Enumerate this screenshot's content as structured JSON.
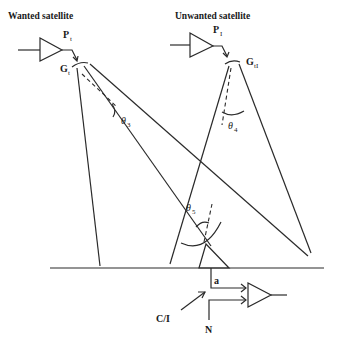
{
  "diagram": {
    "wanted_satellite": {
      "title": "Wanted satellite",
      "power_label": "P",
      "power_sub": "t",
      "gain_label": "G",
      "gain_sub": "t"
    },
    "unwanted_satellite": {
      "title": "Unwanted satellite",
      "power_label": "P",
      "power_sub": "I",
      "gain_label": "G",
      "gain_sub": "tI"
    },
    "angles": {
      "theta3": "θ",
      "theta3_sub": "3",
      "theta4": "θ",
      "theta4_sub": "4",
      "theta5": "θ",
      "theta5_sub": "5"
    },
    "receiver": {
      "node_label": "a",
      "ci_label": "C/I",
      "noise_label": "N"
    },
    "colors": {
      "line": "#2a2a2a",
      "background": "#ffffff"
    }
  }
}
